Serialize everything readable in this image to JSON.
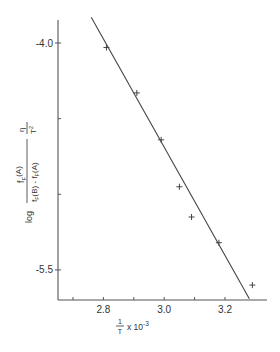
{
  "chart_data": {
    "type": "scatter",
    "title": "",
    "xlabel": "1/T x 10^-3",
    "ylabel": "log [f_F(A) / (f_F(B) - f_F(A))] · η/T²",
    "xlim": [
      2.65,
      3.34
    ],
    "ylim": [
      -5.7,
      -3.85
    ],
    "x_ticks": [
      2.7,
      2.8,
      2.9,
      3.0,
      3.1,
      3.2
    ],
    "x_tick_labels": [
      {
        "value": 2.8,
        "label": "2.8"
      },
      {
        "value": 3.0,
        "label": "3.0"
      },
      {
        "value": 3.2,
        "label": "3.2"
      }
    ],
    "y_ticks": [
      -4.0,
      -4.5,
      -5.0,
      -5.5
    ],
    "y_tick_labels": [
      {
        "value": -4.0,
        "label": "-4.0"
      },
      {
        "value": -5.5,
        "label": "-5.5"
      }
    ],
    "grid": false,
    "marker": "+",
    "series": [
      {
        "name": "data",
        "x": [
          2.81,
          2.91,
          2.99,
          3.05,
          3.09,
          3.18,
          3.29
        ],
        "y": [
          -4.03,
          -4.33,
          -4.64,
          -4.95,
          -5.15,
          -5.32,
          -5.6
        ]
      }
    ],
    "fit_line": {
      "x": [
        2.76,
        3.28
      ],
      "y": [
        -3.83,
        -5.69
      ]
    }
  },
  "labels": {
    "xlabel_num": "1",
    "xlabel_den": "T",
    "xlabel_suffix": "x 10",
    "xlabel_exp": "-3",
    "ylabel_log": "log",
    "ylabel_num": "f",
    "ylabel_num_sub": "F",
    "ylabel_num_arg": "(A)",
    "ylabel_den": "f",
    "ylabel_den_sub": "F",
    "ylabel_den_arg1": "(B) - f",
    "ylabel_den_sub2": "F",
    "ylabel_den_arg2": "(A)",
    "ylabel_eta": "η",
    "ylabel_T": "T",
    "ylabel_T_exp": "2"
  }
}
